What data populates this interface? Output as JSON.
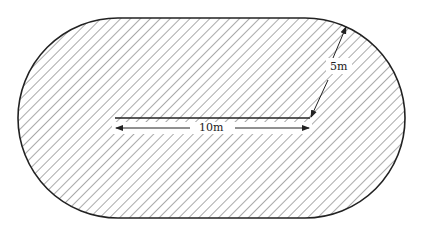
{
  "diagram": {
    "shape": "stadium (rectangle with semicircular ends), hatched",
    "labels": {
      "length": "10m",
      "radius": "5m"
    },
    "colors": {
      "stroke": "#222222",
      "hatch": "#555555",
      "background": "#ffffff"
    }
  }
}
